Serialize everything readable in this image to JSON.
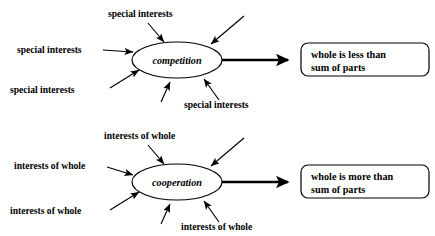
{
  "diagram": {
    "type": "systems-causal-loop",
    "background_color": "#ffffff",
    "line_color": "#000000",
    "groups": [
      {
        "id": "competition",
        "node_label": "competition",
        "input_label": "special interests",
        "input_labels": [
          "special interests",
          "special interests",
          "special interests",
          "special interests"
        ],
        "outcome_line_1": "whole is less than",
        "outcome_line_2": "sum of parts",
        "input_arrow_count": 6,
        "labeled_input_count": 4
      },
      {
        "id": "cooperation",
        "node_label": "cooperation",
        "input_label": "interests of whole",
        "input_labels": [
          "interests of whole",
          "interests of whole",
          "interests of whole",
          "interests of whole"
        ],
        "outcome_line_1": "whole is more than",
        "outcome_line_2": "sum of parts",
        "input_arrow_count": 6,
        "labeled_input_count": 4
      }
    ]
  }
}
